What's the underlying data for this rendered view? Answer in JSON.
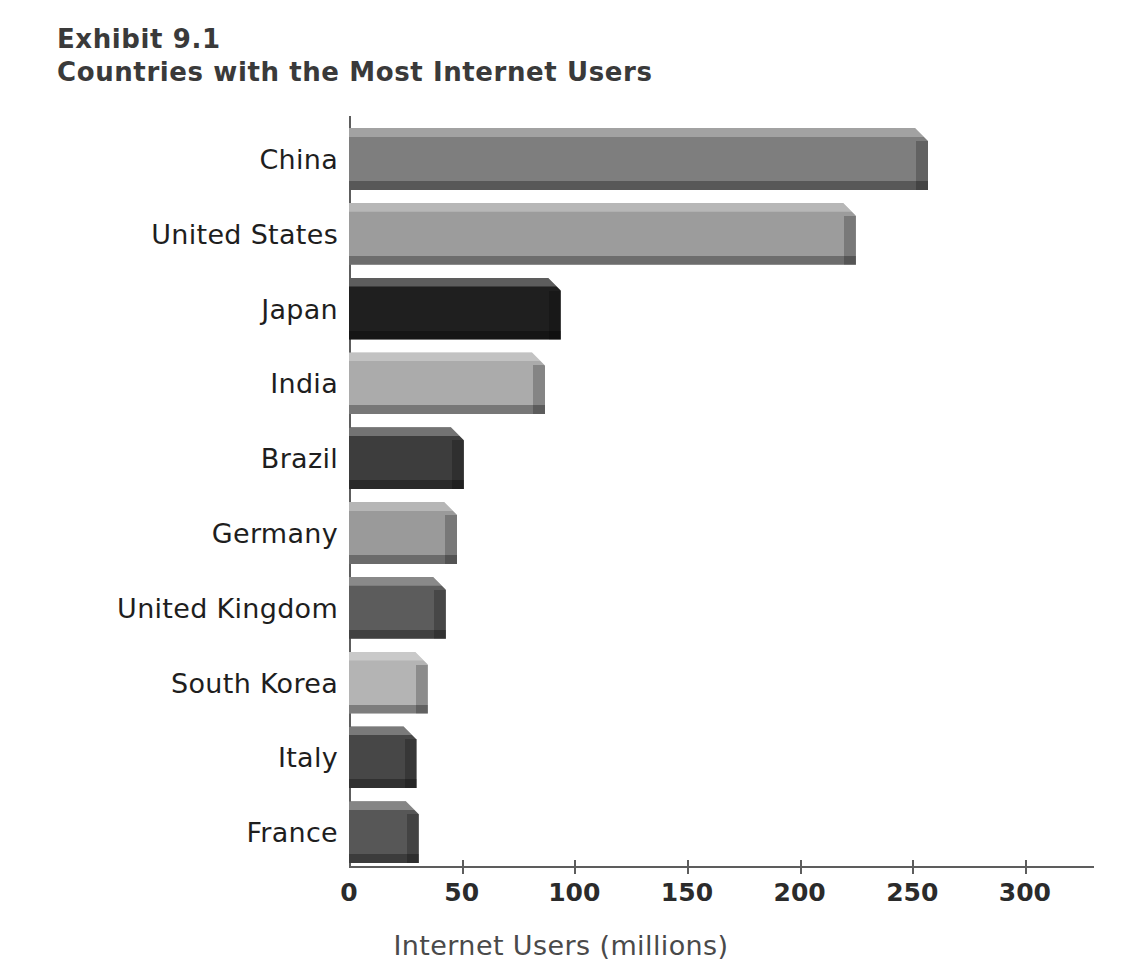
{
  "exhibit": {
    "number_line": "Exhibit 9.1",
    "title_line": "Countries with the Most Internet Users"
  },
  "chart_data": {
    "type": "bar",
    "orientation": "horizontal",
    "title": "Countries with the Most Internet Users",
    "subtitle": "Exhibit 9.1",
    "xlabel": "Internet Users (millions)",
    "ylabel": "",
    "xlim": [
      0,
      325
    ],
    "xticks": [
      0,
      50,
      100,
      150,
      200,
      250,
      300
    ],
    "xtick_labels": [
      "0",
      "50",
      "100",
      "150",
      "200",
      "250",
      "300"
    ],
    "grid": false,
    "legend": "none",
    "categories": [
      "China",
      "United States",
      "Japan",
      "India",
      "Brazil",
      "Germany",
      "United Kingdom",
      "South Korea",
      "Italy",
      "France"
    ],
    "values": [
      257,
      225,
      94,
      87,
      51,
      48,
      43,
      35,
      30,
      31
    ],
    "bar_colors": [
      "#7e7e7e",
      "#9c9c9c",
      "#1f1f1f",
      "#ababab",
      "#3d3d3d",
      "#9a9a9a",
      "#5c5c5c",
      "#b4b4b4",
      "#474747",
      "#575757"
    ],
    "value_unit": "millions"
  },
  "style": {
    "axis_color": "#5d5d5d",
    "title_color": "#3a3a3a",
    "label_color": "#1e1e1e",
    "axis_title_color": "#4a4a4a",
    "background": "#ffffff"
  }
}
